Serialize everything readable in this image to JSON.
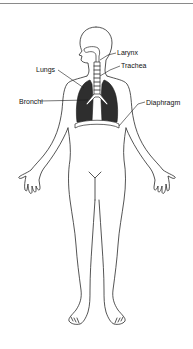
{
  "diagram": {
    "labels": {
      "larynx": "Larynx",
      "trachea": "Trachea",
      "lungs": "Lungs",
      "bronchi": "Bronchi",
      "diaphragm": "Diaphragm"
    },
    "colors": {
      "outline": "#2a2a2a",
      "lung_fill": "#2e2e2e",
      "background": "#ffffff"
    }
  }
}
